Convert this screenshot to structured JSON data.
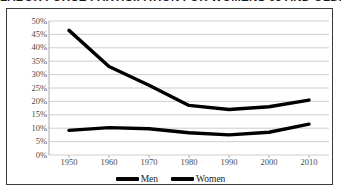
{
  "chart_data": {
    "type": "line",
    "title": "LABOR FORCE PARTICIPATION FOR WOMENS 65 AND OLDER",
    "xlabel": "",
    "ylabel": "",
    "x": [
      1950,
      1960,
      1970,
      1980,
      1990,
      2000,
      2010
    ],
    "categories": [
      "1950",
      "1960",
      "1970",
      "1980",
      "1990",
      "2000",
      "2010"
    ],
    "series": [
      {
        "name": "Men",
        "values": [
          46.5,
          33.0,
          26.0,
          18.5,
          17.0,
          18.0,
          20.5
        ]
      },
      {
        "name": "Women",
        "values": [
          9.2,
          10.2,
          9.8,
          8.3,
          7.5,
          8.5,
          11.5
        ]
      }
    ],
    "ylim": [
      0,
      50
    ],
    "ytick_labels": [
      "50%",
      "45%",
      "40%",
      "35%",
      "30%",
      "25%",
      "20%",
      "15%",
      "10%",
      "5%",
      "0%"
    ],
    "ytick_values": [
      50,
      45,
      40,
      35,
      30,
      25,
      20,
      15,
      10,
      5,
      0
    ],
    "xlim": [
      1945,
      2015
    ],
    "grid": true,
    "grid_axis": "y",
    "legend_position": "bottom",
    "line_color": "#000000",
    "grid_color": "#c8c8c8",
    "axis_color": "#aaaaaa"
  },
  "legend": {
    "items": [
      {
        "label": "Men"
      },
      {
        "label": "Women"
      }
    ]
  }
}
